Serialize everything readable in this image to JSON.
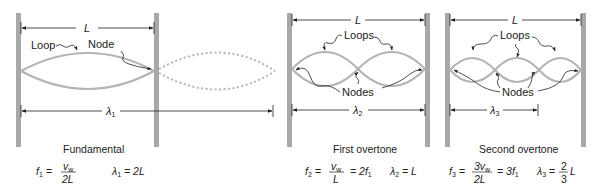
{
  "colors": {
    "wall": "#a8a8a8",
    "string": "#b4b4b4",
    "dotted": "#b4b4b4",
    "ink": "#222222",
    "background": "#ffffff"
  },
  "panels": [
    {
      "id": "fundamental",
      "length_label": "L",
      "wavelength_label": "λ",
      "wavelength_sub": "1",
      "callouts": {
        "loop": "Loop",
        "node": "Node"
      },
      "caption": "Fundamental",
      "formula": {
        "f_sym": "f",
        "f_sub": "1",
        "numerator": "v",
        "numerator_sub": "w",
        "denominator": "2L",
        "extra": "",
        "lambda_eq": "= 2L"
      },
      "loops": 1
    },
    {
      "id": "first-overtone",
      "length_label": "L",
      "wavelength_label": "λ",
      "wavelength_sub": "2",
      "callouts": {
        "loops": "Loops",
        "nodes": "Nodes"
      },
      "caption": "First overtone",
      "formula": {
        "f_sym": "f",
        "f_sub": "2",
        "numerator": "v",
        "numerator_sub": "w",
        "denominator": "L",
        "extra": "= 2f",
        "extra_sub": "1",
        "lambda_eq": "= L"
      },
      "loops": 2
    },
    {
      "id": "second-overtone",
      "length_label": "L",
      "wavelength_label": "λ",
      "wavelength_sub": "3",
      "callouts": {
        "loops": "Loops",
        "nodes": "Nodes"
      },
      "caption": "Second overtone",
      "formula": {
        "f_sym": "f",
        "f_sub": "3",
        "numerator": "3v",
        "numerator_sub": "w",
        "denominator": "2L",
        "extra": "= 3f",
        "extra_sub": "1",
        "lambda_eq": "=",
        "lambda_frac_num": "2",
        "lambda_frac_den": "3",
        "lambda_tail": "L"
      },
      "loops": 3
    }
  ]
}
